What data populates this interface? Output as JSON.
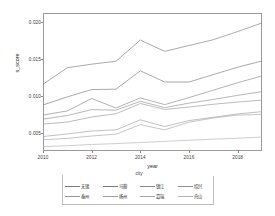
{
  "chart_data": {
    "type": "line",
    "title": "",
    "xlabel": "year",
    "ylabel": "s_score",
    "xlim": [
      2010,
      2019
    ],
    "ylim": [
      0.0026,
      0.0212
    ],
    "xticks": [
      "2010",
      "2012",
      "2014",
      "2016",
      "2018"
    ],
    "xtick_values": [
      2010,
      2012,
      2014,
      2016,
      2018
    ],
    "yticks": [
      "0.005",
      "0.010",
      "0.015",
      "0.020"
    ],
    "ytick_values": [
      0.005,
      0.01,
      0.015,
      0.02
    ],
    "grid": false,
    "legend_title": "city",
    "legend_position": "bottom",
    "x": [
      2010,
      2011,
      2012,
      2013,
      2014,
      2015,
      2016,
      2017,
      2018,
      2019
    ],
    "series": [
      {
        "name": "无锡",
        "color": "#7d7d7d",
        "values": [
          0.0116,
          0.01383,
          0.0143,
          0.0147,
          0.01756,
          0.01603,
          0.01682,
          0.0176,
          0.0187,
          0.01986
        ]
      },
      {
        "name": "马鞍",
        "color": "#7a7a7a",
        "values": [
          0.0088,
          0.0099,
          0.01088,
          0.01093,
          0.01341,
          0.0119,
          0.0119,
          0.0129,
          0.0139,
          0.01473
        ]
      },
      {
        "name": "镇江",
        "color": "#888888",
        "values": [
          0.00745,
          0.008,
          0.00968,
          0.0084,
          0.00975,
          0.00885,
          0.0098,
          0.0108,
          0.0118,
          0.01272
        ]
      },
      {
        "name": "绍兴",
        "color": "#8f8f8f",
        "values": [
          0.0069,
          0.00738,
          0.00818,
          0.0081,
          0.0093,
          0.00845,
          0.00905,
          0.00955,
          0.0101,
          0.0106
        ]
      },
      {
        "name": "泰州",
        "color": "#979797",
        "values": [
          0.00622,
          0.0065,
          0.00718,
          0.00762,
          0.009,
          0.0082,
          0.00852,
          0.0089,
          0.0092,
          0.00945
        ]
      },
      {
        "name": "扬州",
        "color": "#9e9e9e",
        "values": [
          0.00455,
          0.0049,
          0.0053,
          0.00545,
          0.0068,
          0.0059,
          0.0067,
          0.00715,
          0.0076,
          0.0079
        ]
      },
      {
        "name": "嘉瑞",
        "color": "#a5a5a5",
        "values": [
          0.00412,
          0.0043,
          0.00462,
          0.00487,
          0.00615,
          0.00545,
          0.00648,
          0.00705,
          0.00745,
          0.00752
        ]
      },
      {
        "name": "舟山",
        "color": "#b4b4b4",
        "values": [
          0.00318,
          0.00332,
          0.00348,
          0.0036,
          0.00375,
          0.0039,
          0.00405,
          0.0042,
          0.00432,
          0.00448
        ]
      }
    ]
  }
}
